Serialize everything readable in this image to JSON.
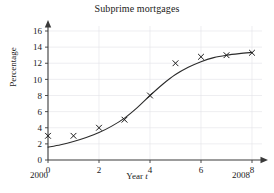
{
  "chart_data": {
    "type": "scatter",
    "title": "Subprime mortgages",
    "xlabel": "Year t",
    "xlabel_prefix": "Year ",
    "xlabel_variable": "t",
    "ylabel": "Percentage",
    "xlim": [
      0,
      8
    ],
    "ylim": [
      0,
      16
    ],
    "xticks": [
      0,
      2,
      4,
      6,
      8
    ],
    "xticklabels": [
      "0",
      "2",
      "4",
      "6",
      "8"
    ],
    "yticks": [
      0,
      2,
      4,
      6,
      8,
      10,
      12,
      14,
      16
    ],
    "yticklabels": [
      "0",
      "2",
      "4",
      "6",
      "8",
      "10",
      "12",
      "14",
      "16"
    ],
    "grid": true,
    "legend": "none",
    "axis_start_label": "2000",
    "axis_end_label": "2008",
    "marker": "x",
    "x": [
      0,
      1,
      2,
      3,
      4,
      5,
      6,
      7,
      8
    ],
    "values": [
      3.0,
      3.0,
      4.0,
      5.0,
      8.0,
      12.0,
      12.8,
      13.0,
      13.3
    ],
    "series": [
      {
        "name": "Subprime mortgage percentage",
        "x": [
          0,
          1,
          2,
          3,
          4,
          5,
          6,
          7,
          8
        ],
        "values": [
          3.0,
          3.0,
          4.0,
          5.0,
          8.0,
          12.0,
          12.8,
          13.0,
          13.3
        ]
      },
      {
        "name": "fitted logistic curve",
        "type": "line",
        "x": [
          0,
          0.5,
          1,
          1.5,
          2,
          2.5,
          3,
          3.5,
          4,
          4.5,
          5,
          5.5,
          6,
          6.5,
          7,
          7.5,
          8
        ],
        "values": [
          1.6,
          1.9,
          2.3,
          2.8,
          3.4,
          4.2,
          5.2,
          6.5,
          8.0,
          9.4,
          10.6,
          11.5,
          12.2,
          12.7,
          13.0,
          13.2,
          13.35
        ]
      }
    ],
    "colors": {
      "curve": "#2b2b2b",
      "marker": "#1a1a1a",
      "grid": "#e2e2e8",
      "axis": "#3a3a3a"
    }
  }
}
